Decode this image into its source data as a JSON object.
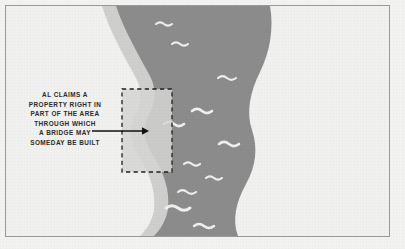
{
  "figure": {
    "name": "riverbank-property-claim-diagram",
    "background_color": "#f1f1ef",
    "frame_color": "#9a9a98"
  },
  "caption": {
    "name": "annotation-caption",
    "lines": [
      "AL CLAIMS A",
      "PROPERTY RIGHT IN",
      "PART OF THE AREA",
      "THROUGH WHICH",
      "A BRIDGE MAY",
      "SOMEDAY BE BUILT"
    ],
    "text_color": "#2b2b2b"
  },
  "map": {
    "river": {
      "label": "river",
      "water_color": "#8c8c8c",
      "bank_color": "#cfcfcd",
      "wave_color": "#f0f0ee",
      "wave_count": 11
    },
    "claim_area": {
      "label": "claimed-property-parcel",
      "outline_style": "dashed",
      "outline_color": "#1f1f1f",
      "fill_color": "#d8d8d6",
      "x": 116,
      "y": 83,
      "width": 50,
      "height": 83
    },
    "pointer": {
      "label": "arrow-pointing-to-claim-area",
      "color": "#111111",
      "direction": "right",
      "from_x": 86,
      "to_x": 140,
      "y": 125
    }
  }
}
